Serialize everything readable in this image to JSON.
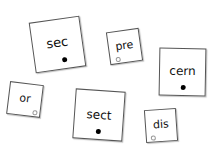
{
  "cards": [
    {
      "word": "sec",
      "marker": "filled"
    },
    {
      "word": "pre",
      "marker": "open"
    },
    {
      "word": "cern",
      "marker": "filled"
    },
    {
      "word": "or",
      "marker": "open"
    },
    {
      "word": "sect",
      "marker": "filled"
    },
    {
      "word": "dis",
      "marker": "open"
    }
  ]
}
